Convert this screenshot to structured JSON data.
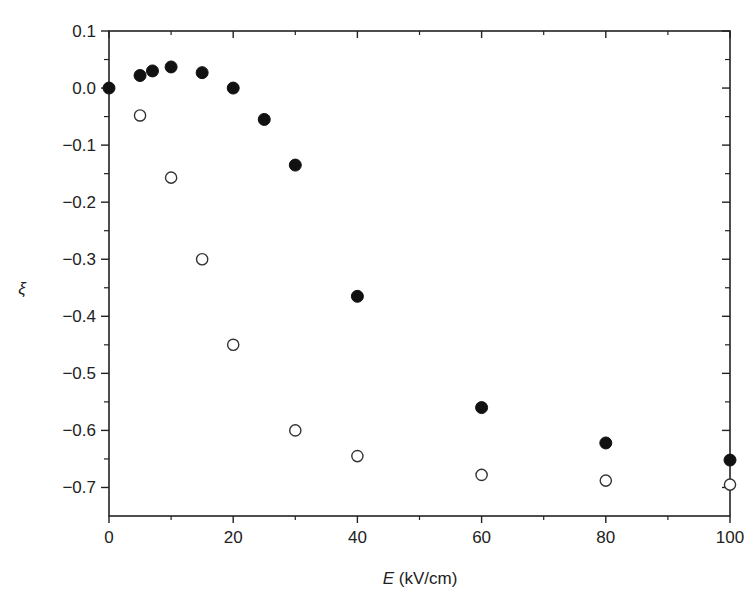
{
  "chart_data": {
    "type": "scatter",
    "title": "",
    "xlabel": "E (kV/cm)",
    "xlabel_var": "E",
    "xlabel_unit": " (kV/cm)",
    "ylabel": "ξ",
    "xlim": [
      0,
      100
    ],
    "ylim": [
      -0.75,
      0.1
    ],
    "x_ticks": [
      0,
      20,
      40,
      60,
      80,
      100
    ],
    "x_tick_labels": [
      "0",
      "20",
      "40",
      "60",
      "80",
      "100"
    ],
    "y_ticks": [
      0.1,
      0.0,
      -0.1,
      -0.2,
      -0.3,
      -0.4,
      -0.5,
      -0.6,
      -0.7
    ],
    "y_tick_labels": [
      "0.1",
      "0.0",
      "−0.1",
      "−0.2",
      "−0.3",
      "−0.4",
      "−0.5",
      "−0.6",
      "−0.7"
    ],
    "grid": false,
    "legend": null,
    "series": [
      {
        "name": "filled circles",
        "marker": "filled-circle",
        "color": "#111111",
        "x": [
          0,
          5,
          7,
          10,
          15,
          20,
          25,
          30,
          40,
          60,
          80,
          100
        ],
        "y": [
          0.0,
          0.022,
          0.03,
          0.037,
          0.027,
          0.0,
          -0.055,
          -0.135,
          -0.365,
          -0.56,
          -0.622,
          -0.652
        ]
      },
      {
        "name": "open circles",
        "marker": "open-circle",
        "color": "#333333",
        "x": [
          5,
          10,
          15,
          20,
          30,
          40,
          60,
          80,
          100
        ],
        "y": [
          -0.048,
          -0.157,
          -0.3,
          -0.45,
          -0.6,
          -0.645,
          -0.678,
          -0.688,
          -0.695
        ]
      }
    ]
  }
}
